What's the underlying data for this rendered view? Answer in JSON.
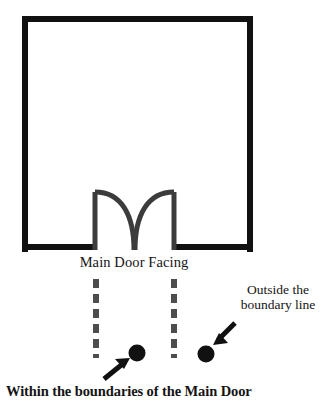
{
  "diagram": {
    "title_text_visible": false,
    "background_color": "#ffffff",
    "stroke_color": "#1a1a1a",
    "dash_color": "#4d4d4d",
    "arc_color": "#3c3c3c",
    "labels": {
      "main_door_facing": "Main Door Facing",
      "outside_boundary_line_1": "Outside the",
      "outside_boundary_line_2": "boundary line",
      "within_boundaries": "Within the boundaries of the Main Door"
    },
    "shapes": {
      "house_outline_name": "house-rectangle",
      "door_opening_name": "main-door-opening",
      "left_door_swing_name": "left-door-swing-arc",
      "right_door_swing_name": "right-door-swing-arc",
      "left_boundary_dashes_name": "left-boundary-dashed-line",
      "right_boundary_dashes_name": "right-boundary-dashed-line",
      "inside_dot_name": "inside-position-dot",
      "outside_dot_name": "outside-position-dot",
      "inside_arrow_name": "inside-pointer-arrow",
      "outside_arrow_name": "outside-pointer-arrow"
    },
    "geometry": {
      "house_left": 22,
      "house_top": 16,
      "house_right": 253,
      "house_bottom": 250,
      "wall_thickness": 6,
      "door_left_jamb_x": 94,
      "door_right_jamb_x": 175,
      "door_head_y": 192,
      "dash_left_x": 96,
      "dash_right_x": 174,
      "dash_top_y": 278,
      "dash_bottom_y": 358,
      "inside_dot_x": 137,
      "inside_dot_y": 353,
      "outside_dot_x": 206,
      "outside_dot_y": 354,
      "dot_radius": 8
    }
  }
}
